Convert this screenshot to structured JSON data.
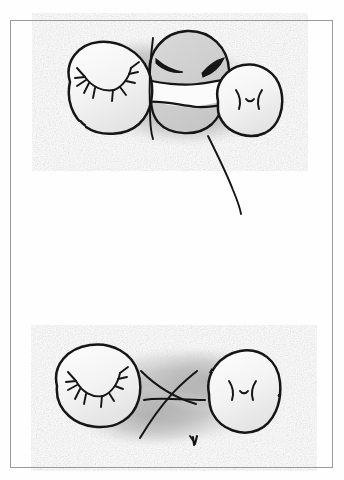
{
  "artwork": {
    "medium": "graphite pencil on white paper",
    "title": "Two-panel pencil sketch of blob creatures",
    "paper_color": "#fefefe",
    "ink_color": "#1a1a1a",
    "shadow_color": "#b4b4b4",
    "frame_color": "#9a9a9a",
    "frame": {
      "x": 10,
      "y": 20,
      "width": 323,
      "height": 448,
      "stroke_width": 1
    },
    "panels": [
      {
        "id": "top-scene",
        "name": "upper-group-of-three-blobs",
        "description": "Three rounded blob shapes overlapping, resting on a soft pencil-shaded cloud, with a long curved tail-line trailing down to the lower right.",
        "shadow": {
          "cx": 168,
          "cy": 95,
          "rx": 100,
          "ry": 57
        },
        "elements": [
          {
            "id": "blob-left-lashes",
            "name": "left-blob-with-closed-lashed-eyes",
            "face": "two closed eyes drawn as arcs with radiating eyelashes",
            "cx": 108,
            "cy": 88,
            "rx": 42,
            "ry": 43
          },
          {
            "id": "blob-center-masked",
            "name": "center-blob-with-closed-eyes-and-band",
            "face": "two thick downturned closed-eye arcs above a white horizontal band",
            "cx": 185,
            "cy": 80,
            "rx": 45,
            "ry": 48
          },
          {
            "id": "blob-right-face",
            "name": "right-blob-with-paren-dash-paren-face",
            "face": ")-(",
            "cx": 249,
            "cy": 100,
            "rx": 33,
            "ry": 35
          },
          {
            "id": "vertical-stroke",
            "name": "vertical-divider-stroke",
            "description": "near-vertical pencil line running down through the center blob"
          },
          {
            "id": "tail-line",
            "name": "trailing-tail-line",
            "description": "long curved line descending from below the center toward lower right"
          }
        ]
      },
      {
        "id": "bottom-scene",
        "name": "lower-group-of-two-blobs",
        "description": "Two blob shapes separated by a large X / crossed-lines mark, on a soft pencil-shaded cloud.",
        "shadow": {
          "cx": 172,
          "cy": 400,
          "rx": 100,
          "ry": 52
        },
        "elements": [
          {
            "id": "blob-bl-lashes",
            "name": "bottom-left-blob-with-closed-lashed-eyes",
            "face": "two closed eyes drawn as arcs with radiating eyelashes",
            "cx": 97,
            "cy": 385,
            "rx": 42,
            "ry": 40
          },
          {
            "id": "cross-mark",
            "name": "crossed-x-mark",
            "description": "large X with a horizontal line through its intersection and a small three-pronged foot at the lower right leg"
          },
          {
            "id": "blob-br-face",
            "name": "bottom-right-blob-with-paren-dash-paren-face",
            "face": ")-(",
            "cx": 243,
            "cy": 391,
            "rx": 34,
            "ry": 42
          }
        ]
      }
    ]
  }
}
